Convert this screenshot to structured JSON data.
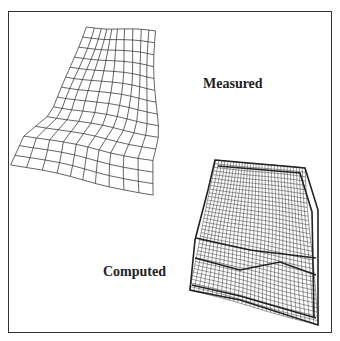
{
  "figure": {
    "labels": {
      "measured": "Measured",
      "computed": "Computed"
    },
    "colors": {
      "frame": "#333333",
      "mesh": "#222222",
      "background": "#ffffff"
    },
    "measured_mesh": {
      "description": "Deformed wireframe mesh of measured crash specimen",
      "rows": 14,
      "cols": 10,
      "outline": [
        [
          85,
          27
        ],
        [
          155,
          31
        ],
        [
          158,
          58
        ],
        [
          153,
          100
        ],
        [
          160,
          130
        ],
        [
          158,
          195
        ],
        [
          100,
          185
        ],
        [
          33,
          166
        ],
        [
          28,
          150
        ],
        [
          40,
          118
        ],
        [
          52,
          72
        ]
      ]
    },
    "computed_mesh": {
      "description": "Dense computed finite element mesh",
      "rows": 36,
      "cols": 30,
      "outline": [
        [
          215,
          160
        ],
        [
          305,
          168
        ],
        [
          318,
          210
        ],
        [
          320,
          250
        ],
        [
          318,
          325
        ],
        [
          240,
          300
        ],
        [
          190,
          290
        ],
        [
          195,
          240
        ],
        [
          208,
          190
        ]
      ]
    }
  }
}
